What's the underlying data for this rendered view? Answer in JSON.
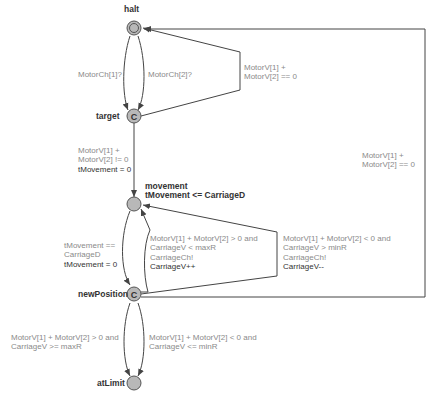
{
  "diagram": {
    "type": "timed-automaton",
    "locations": [
      {
        "id": "halt",
        "name": "halt",
        "initial": true,
        "committed": false
      },
      {
        "id": "target",
        "name": "target",
        "committed": true,
        "marker": "C"
      },
      {
        "id": "movement",
        "name": "movement",
        "invariant": "tMovement <= CarriageD",
        "committed": false
      },
      {
        "id": "newPosition",
        "name": "newPosition",
        "committed": true,
        "marker": "C"
      },
      {
        "id": "atLimit",
        "name": "atLimit",
        "committed": false
      }
    ],
    "edges": {
      "halt_target_1": {
        "sync": "MotorCh[1]?"
      },
      "halt_target_2": {
        "sync": "MotorCh[2]?"
      },
      "target_halt": {
        "guard_l1": "MotorV[1] +",
        "guard_l2": "MotorV[2] == 0"
      },
      "target_movement": {
        "guard_l1": "MotorV[1] +",
        "guard_l2": "MotorV[2] != 0",
        "assign": "tMovement = 0"
      },
      "movement_newPosition": {
        "guard_l1": "tMovement ==",
        "guard_l2": "CarriageD",
        "assign": "tMovement = 0"
      },
      "newPosition_movement_inc": {
        "guard_l1": "MotorV[1] + MotorV[2] > 0 and",
        "guard_l2": "CarriageV < maxR",
        "sync": "CarriageCh!",
        "assign": "CarriageV++"
      },
      "newPosition_movement_dec": {
        "guard_l1": "MotorV[1] + MotorV[2] < 0 and",
        "guard_l2": "CarriageV > minR",
        "sync": "CarriageCh!",
        "assign": "CarriageV--"
      },
      "newPosition_halt": {
        "guard_l1": "MotorV[1] +",
        "guard_l2": "MotorV[2] == 0"
      },
      "newPosition_atLimit_max": {
        "guard_l1": "MotorV[1] + MotorV[2] > 0 and",
        "guard_l2": "CarriageV >= maxR"
      },
      "newPosition_atLimit_min": {
        "guard_l1": "MotorV[1] + MotorV[2] < 0 and",
        "guard_l2": "CarriageV <= minR"
      }
    },
    "colors": {
      "node_fill": "#b8b8b8",
      "node_stroke": "#555555",
      "edge": "#444444",
      "guard_text": "#8a8a8a",
      "assign_text": "#333333"
    }
  }
}
